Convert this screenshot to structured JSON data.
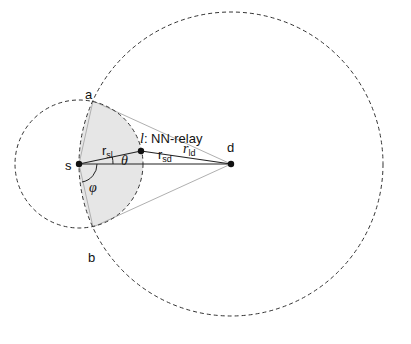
{
  "diagram": {
    "nodes": {
      "s": {
        "label": "s",
        "x": 79,
        "y": 164
      },
      "d": {
        "label": "d",
        "x": 231,
        "y": 164
      },
      "l": {
        "label": "l",
        "suffix": ": NN-relay",
        "x": 141,
        "y": 151
      },
      "a": {
        "label": "a",
        "x": 93,
        "y": 101
      },
      "b": {
        "label": "b",
        "x": 93,
        "y": 227
      }
    },
    "edges": {
      "r_sl": {
        "base": "r",
        "sub": "sl"
      },
      "r_ld": {
        "base": "r",
        "sub": "ld"
      },
      "r_sd": {
        "base": "r",
        "sub": "sd"
      }
    },
    "angles": {
      "theta": "θ",
      "phi": "φ"
    },
    "circles": {
      "small": {
        "center": "s",
        "radius": 64,
        "style": "dashed"
      },
      "large": {
        "center": "d",
        "radius": 152,
        "style": "dashed"
      }
    },
    "colors": {
      "shade": "#e6e6e6",
      "line": "#222222",
      "tangent": "#b0b0b0"
    }
  }
}
